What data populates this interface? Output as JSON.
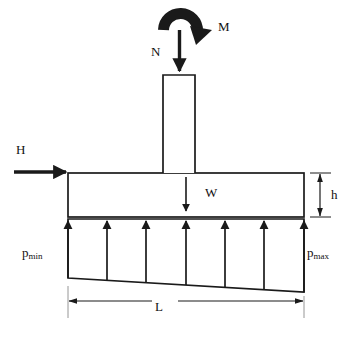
{
  "figure": {
    "type": "engineering-free-body-diagram",
    "stroke_color": "#1a1a1a",
    "background_color": "#ffffff"
  },
  "labels": {
    "axial_load": "N",
    "moment": "M",
    "horizontal_force": "H",
    "self_weight": "W",
    "footing_thickness": "h",
    "pressure_min": "p",
    "pressure_min_sub": "min",
    "pressure_max": "p",
    "pressure_max_sub": "max",
    "footing_length": "L"
  },
  "geometry": {
    "footing": {
      "x": 68,
      "y": 173,
      "width": 236,
      "height": 44
    },
    "column": {
      "x": 163,
      "y": 75,
      "width": 32,
      "height": 98
    },
    "pressure_arrow_x": [
      68,
      107,
      146,
      186,
      225,
      264,
      304
    ],
    "pressure_top_y": 219,
    "pressure_bottom_left_y": 278,
    "pressure_bottom_right_y": 292,
    "dimension_line_y": 301,
    "thickness_dim_x": 320
  }
}
